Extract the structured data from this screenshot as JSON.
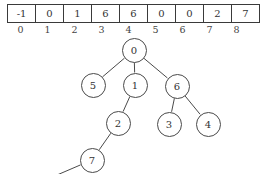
{
  "figure": {
    "array": {
      "values": [
        "-1",
        "0",
        "1",
        "6",
        "6",
        "0",
        "0",
        "2",
        "7"
      ],
      "indices": [
        "0",
        "1",
        "2",
        "3",
        "4",
        "5",
        "6",
        "7",
        "8"
      ]
    },
    "tree": {
      "nodes": [
        {
          "label": "0",
          "x": 134,
          "y": 50
        },
        {
          "label": "5",
          "x": 93,
          "y": 85
        },
        {
          "label": "1",
          "x": 135,
          "y": 85
        },
        {
          "label": "6",
          "x": 177,
          "y": 86
        },
        {
          "label": "2",
          "x": 118,
          "y": 123
        },
        {
          "label": "3",
          "x": 169,
          "y": 124
        },
        {
          "label": "4",
          "x": 208,
          "y": 124
        },
        {
          "label": "7",
          "x": 92,
          "y": 160
        }
      ],
      "edges": [
        {
          "from": "0",
          "to": "5"
        },
        {
          "from": "0",
          "to": "1"
        },
        {
          "from": "0",
          "to": "6"
        },
        {
          "from": "1",
          "to": "2"
        },
        {
          "from": "6",
          "to": "3"
        },
        {
          "from": "6",
          "to": "4"
        },
        {
          "from": "2",
          "to": "7"
        },
        {
          "from": "7",
          "to": "offscreen"
        }
      ]
    },
    "colors": {
      "stroke": "#4a4a4a",
      "text": "#333333",
      "background": "#ffffff"
    }
  }
}
